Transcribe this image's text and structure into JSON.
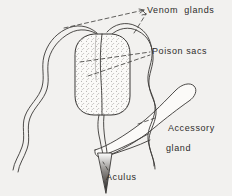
{
  "figure": {
    "name": "sting-apparatus-diagram",
    "background_color": "#f2f1ef",
    "ink_color": "#3a3836",
    "stipple_color": "#6b6866",
    "labels": {
      "venom_glands": "Venom  glands",
      "poison_sacs": "Poison sacs",
      "accessory_gland_line1": "Accessory",
      "accessory_gland_line2": "gland",
      "aculus": "Aculus"
    },
    "parts": [
      {
        "id": "venom-gland-left",
        "label": "Venom  glands",
        "shape": "long wavy double-walled tubule descending to lower left"
      },
      {
        "id": "venom-gland-right",
        "label": "Venom  glands",
        "shape": "long wavy double-walled tubule descending to lower right"
      },
      {
        "id": "poison-sacs",
        "label": "Poison sacs",
        "shape": "rounded rectangular stippled reservoir divided into two lobes"
      },
      {
        "id": "accessory-gland",
        "label": "Accessory gland",
        "shape": "thick club-shaped gland running from lower left to upper right"
      },
      {
        "id": "aculus",
        "label": "Aculus",
        "shape": "narrow dark triangular sting spike at bottom centre"
      }
    ],
    "leaders": [
      {
        "from": "venom-gland-left",
        "to": "Venom  glands",
        "style": "dashed-arrow"
      },
      {
        "from": "venom-gland-right",
        "to": "Venom  glands",
        "style": "dashed-arrow"
      },
      {
        "from": "poison-sac-left-lobe",
        "to": "Poison sacs",
        "style": "dashed"
      },
      {
        "from": "poison-sac-right-lobe",
        "to": "Poison sacs",
        "style": "dashed"
      },
      {
        "from": "accessory-gland",
        "to": "Accessory gland",
        "style": "dashed"
      },
      {
        "from": "aculus",
        "to": "Aculus",
        "style": "dashed"
      }
    ]
  }
}
